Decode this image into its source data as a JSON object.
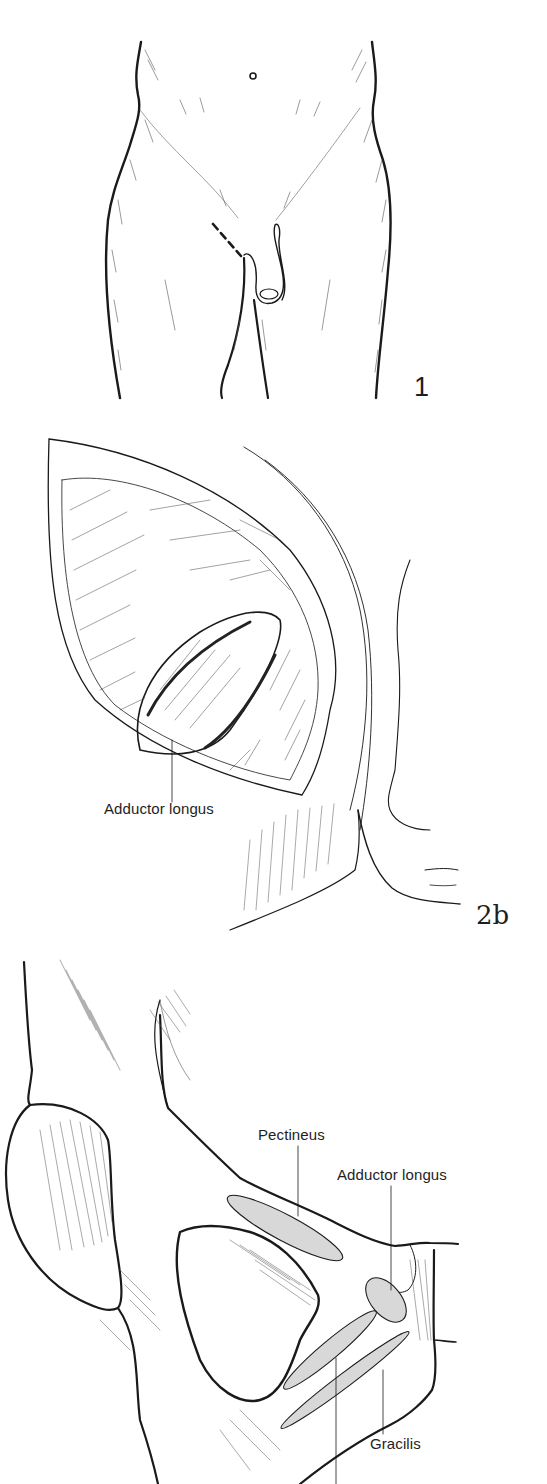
{
  "figures": [
    {
      "id": "fig1",
      "number": "1",
      "description": "Anterior view of lower abdomen and thighs with dashed incision line at right groin",
      "labels": []
    },
    {
      "id": "fig2b",
      "number": "2b",
      "description": "Surgical exposure through groin incision showing muscle",
      "labels": [
        {
          "text": "Adductor longus"
        }
      ]
    },
    {
      "id": "fig3",
      "number": "",
      "description": "Pubic bone with muscle attachment sites shaded",
      "labels": [
        {
          "text": "Pectineus"
        },
        {
          "text": "Adductor longus"
        },
        {
          "text": "Gracilis"
        }
      ]
    }
  ],
  "colors": {
    "ink": "#1a1a1a",
    "attachment_fill": "#d8d8d8",
    "background": "#ffffff"
  }
}
